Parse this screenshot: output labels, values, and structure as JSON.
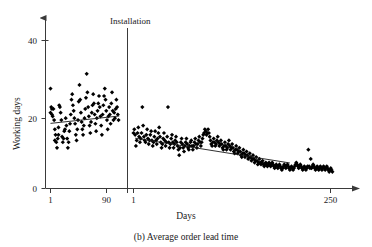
{
  "caption": "(b) Average order lead time",
  "annotations": {
    "installation": "Installation"
  },
  "colors": {
    "ink": "#1a1a1a",
    "axis": "#3a3a3a",
    "marker": "#000000"
  },
  "chart_data": {
    "type": "scatter",
    "title": "(b) Average order lead time",
    "xlabel": "Days",
    "ylabel": "Working days",
    "grid": false,
    "legend": "none",
    "ylim": [
      0,
      44
    ],
    "yticks": [
      0,
      20,
      40
    ],
    "ytick_labels": [
      "0",
      "20",
      "40"
    ],
    "panels": [
      {
        "name": "pre-installation",
        "xlim": [
          1,
          97
        ],
        "xticks": [
          1,
          90
        ],
        "xtick_labels": [
          "1",
          "90"
        ],
        "trendline": {
          "x": [
            1,
            96
          ],
          "y": [
            17.6,
            19.6
          ]
        },
        "x": [
          1,
          1,
          2,
          3,
          3,
          4,
          5,
          6,
          7,
          7,
          8,
          9,
          10,
          11,
          12,
          12,
          13,
          14,
          15,
          16,
          17,
          18,
          19,
          20,
          21,
          22,
          23,
          24,
          25,
          26,
          27,
          28,
          29,
          30,
          31,
          32,
          33,
          34,
          35,
          36,
          37,
          38,
          39,
          40,
          41,
          42,
          43,
          44,
          45,
          46,
          47,
          48,
          49,
          50,
          51,
          52,
          53,
          54,
          55,
          56,
          57,
          58,
          59,
          60,
          61,
          62,
          63,
          64,
          65,
          66,
          67,
          68,
          69,
          70,
          71,
          72,
          73,
          74,
          75,
          76,
          77,
          78,
          79,
          80,
          81,
          82,
          83,
          84,
          85,
          86,
          87,
          88,
          89,
          90,
          91,
          92,
          93,
          94,
          95,
          96
        ],
        "y": [
          27,
          20.5,
          22,
          21.5,
          20,
          19.5,
          21.5,
          18.5,
          16,
          13,
          14.5,
          12.5,
          11,
          13.5,
          14.5,
          16.5,
          22.5,
          22,
          20.5,
          18.5,
          14,
          12.5,
          13.5,
          15.5,
          16,
          19,
          17,
          13.5,
          11,
          12.5,
          15.5,
          17.5,
          20,
          24,
          25.5,
          22.5,
          21,
          19,
          17.5,
          14.5,
          13,
          16,
          18.5,
          23.5,
          28,
          24,
          20.5,
          18,
          16,
          14.5,
          17,
          19,
          21.5,
          24.5,
          31,
          26,
          22,
          19.5,
          17,
          15,
          18,
          20.5,
          22.5,
          25.5,
          23,
          20,
          17.5,
          15.5,
          19,
          21,
          23,
          25,
          22,
          19.5,
          17,
          14.5,
          20,
          22.5,
          25,
          27,
          24,
          21,
          18.5,
          16,
          19.5,
          22,
          20,
          17.5,
          23,
          26,
          21,
          18.5,
          20.5,
          19,
          21.5,
          24,
          22,
          20,
          18.5
        ]
      },
      {
        "name": "post-installation",
        "xlim": [
          1,
          256
        ],
        "xticks": [
          1,
          250
        ],
        "xtick_labels": [
          "1",
          "250"
        ],
        "trendline": {
          "x": [
            3,
            196
          ],
          "y": [
            13.6,
            6.9
          ]
        },
        "x": [
          1,
          2,
          3,
          4,
          5,
          6,
          7,
          8,
          9,
          10,
          11,
          12,
          13,
          14,
          15,
          16,
          17,
          18,
          19,
          20,
          21,
          22,
          23,
          24,
          25,
          26,
          27,
          28,
          29,
          30,
          31,
          32,
          33,
          34,
          35,
          36,
          37,
          38,
          39,
          40,
          41,
          42,
          43,
          44,
          45,
          46,
          47,
          48,
          49,
          50,
          51,
          52,
          53,
          54,
          55,
          56,
          57,
          58,
          59,
          60,
          61,
          62,
          63,
          64,
          65,
          66,
          67,
          68,
          69,
          70,
          71,
          72,
          73,
          74,
          75,
          76,
          77,
          78,
          79,
          80,
          81,
          82,
          83,
          84,
          85,
          86,
          87,
          88,
          89,
          90,
          91,
          92,
          93,
          94,
          95,
          96,
          97,
          98,
          99,
          100,
          101,
          102,
          103,
          104,
          105,
          106,
          107,
          108,
          109,
          110,
          111,
          112,
          113,
          114,
          115,
          116,
          117,
          118,
          119,
          120,
          121,
          122,
          123,
          124,
          125,
          126,
          127,
          128,
          129,
          130,
          131,
          132,
          133,
          134,
          135,
          136,
          137,
          138,
          139,
          140,
          141,
          142,
          143,
          144,
          145,
          146,
          147,
          148,
          149,
          150,
          151,
          152,
          153,
          154,
          155,
          156,
          157,
          158,
          159,
          160,
          161,
          162,
          163,
          164,
          165,
          166,
          167,
          168,
          169,
          170,
          171,
          172,
          173,
          174,
          175,
          176,
          177,
          178,
          179,
          180,
          181,
          182,
          183,
          184,
          185,
          186,
          187,
          188,
          189,
          190,
          191,
          192,
          193,
          194,
          195,
          196,
          197,
          198,
          199,
          200,
          201,
          202,
          203,
          204,
          205,
          206,
          207,
          208,
          209,
          210,
          211,
          212,
          213,
          214,
          215,
          216,
          217,
          218,
          219,
          220,
          221,
          222,
          223,
          224,
          225,
          226,
          227,
          228,
          229,
          230,
          231,
          232,
          233,
          234,
          235,
          236,
          237,
          238,
          239,
          240,
          241,
          242,
          243,
          244,
          245,
          246,
          247,
          248,
          249,
          250
        ],
        "y": [
          15,
          16,
          14.5,
          11.5,
          13,
          15,
          16.5,
          14,
          12.5,
          13.5,
          15,
          22,
          17,
          14,
          13,
          12.5,
          14.5,
          16,
          13.5,
          12,
          13,
          14.5,
          15.5,
          13,
          11.5,
          12.5,
          14,
          15.5,
          13,
          12,
          13.5,
          15,
          16.5,
          14,
          12.5,
          11,
          12,
          13.5,
          15,
          13,
          11.5,
          12.5,
          14,
          22,
          12.5,
          11,
          12,
          13.5,
          14.5,
          12.5,
          11,
          12,
          13,
          14,
          12.5,
          11.5,
          10.5,
          9,
          11,
          12.5,
          13.5,
          12,
          11,
          10,
          11.5,
          12.5,
          13.5,
          12,
          11,
          10.5,
          11.5,
          12.5,
          13,
          11.5,
          10.5,
          11.5,
          12.5,
          13.5,
          12,
          11,
          12,
          13,
          14,
          12.5,
          11.5,
          12.5,
          13.5,
          14.5,
          15,
          16,
          15.5,
          14.5,
          15,
          16,
          15,
          14,
          13,
          12,
          11.5,
          12.5,
          13.5,
          12.5,
          11.5,
          12,
          13,
          14,
          12.5,
          11.5,
          12,
          13,
          12,
          11,
          10.5,
          11.5,
          12.5,
          11.5,
          10.5,
          11,
          12,
          13,
          11.5,
          10.5,
          11,
          12,
          11,
          10,
          9.5,
          10.5,
          11.5,
          10.5,
          9.5,
          10,
          11,
          10,
          9,
          8.5,
          9.5,
          10.5,
          9.5,
          8.5,
          9,
          10,
          9,
          8,
          8.5,
          9.5,
          8.5,
          7.5,
          8,
          9,
          8,
          7,
          7.5,
          8.5,
          7.5,
          6.5,
          7,
          8,
          7,
          6.5,
          7,
          7.5,
          6.5,
          6,
          6.5,
          7,
          6.5,
          6,
          6.5,
          7,
          6.5,
          6,
          6.5,
          7,
          6.5,
          6,
          5.5,
          6,
          6.5,
          6,
          5.5,
          6,
          6.5,
          6,
          5.5,
          5,
          5.5,
          6,
          6.5,
          6,
          5.5,
          6,
          6.5,
          6,
          5.5,
          5,
          5.5,
          6,
          5.5,
          5,
          5.5,
          6,
          6.5,
          7,
          6.5,
          6,
          5.5,
          6,
          6.5,
          6,
          5.5,
          5,
          5.5,
          6,
          5.5,
          5,
          5.5,
          6,
          10.5,
          6,
          5.5,
          8,
          5.5,
          6,
          6.5,
          6,
          5.5,
          5,
          5.5,
          6,
          5.5,
          5,
          5.5,
          6,
          5.5,
          5,
          5.5,
          6,
          5.5,
          5,
          5.5,
          6,
          5.5,
          5,
          4.5,
          5,
          5.5,
          5,
          4.5
        ]
      }
    ]
  }
}
